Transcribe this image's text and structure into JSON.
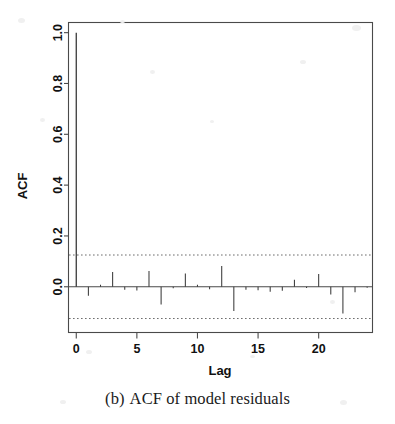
{
  "figure": {
    "caption_label": "(b)",
    "caption_text": "ACF of model residuals",
    "background_color": "#ffffff",
    "ink_color": "#3a3a3a"
  },
  "chart_data": {
    "type": "bar",
    "title": "",
    "subtitle": "",
    "xlabel": "Lag",
    "ylabel": "ACF",
    "xlim": [
      -0.6,
      24.4
    ],
    "ylim": [
      -0.18,
      1.04
    ],
    "xticks": [
      0,
      5,
      10,
      15,
      20
    ],
    "xtick_labels": [
      "0",
      "5",
      "10",
      "15",
      "20"
    ],
    "yticks": [
      0.0,
      0.2,
      0.4,
      0.6,
      0.8,
      1.0
    ],
    "ytick_labels": [
      "0.0",
      "0.2",
      "0.4",
      "0.6",
      "0.8",
      "1.0"
    ],
    "grid": false,
    "legend": null,
    "zero_line": 0.0,
    "confidence_bands": {
      "upper": 0.125,
      "lower": -0.125,
      "style": "dotted",
      "label": "95% significance bounds"
    },
    "categories": [
      0,
      1,
      2,
      3,
      4,
      5,
      6,
      7,
      8,
      9,
      10,
      11,
      12,
      13,
      14,
      15,
      16,
      17,
      18,
      19,
      20,
      21,
      22,
      23,
      24
    ],
    "x": [
      0,
      1,
      2,
      3,
      4,
      5,
      6,
      7,
      8,
      9,
      10,
      11,
      12,
      13,
      14,
      15,
      16,
      17,
      18,
      19,
      20,
      21,
      22,
      23,
      24
    ],
    "values": [
      1.0,
      -0.035,
      0.008,
      0.058,
      -0.012,
      -0.015,
      0.062,
      -0.07,
      -0.006,
      0.052,
      0.008,
      -0.01,
      0.082,
      -0.095,
      -0.012,
      -0.014,
      -0.02,
      -0.016,
      0.028,
      -0.005,
      0.05,
      -0.03,
      -0.105,
      -0.022,
      -0.004
    ],
    "series": [
      {
        "name": "ACF of model residuals",
        "values": [
          1.0,
          -0.035,
          0.008,
          0.058,
          -0.012,
          -0.015,
          0.062,
          -0.07,
          -0.006,
          0.052,
          0.008,
          -0.01,
          0.082,
          -0.095,
          -0.012,
          -0.014,
          -0.02,
          -0.016,
          0.028,
          -0.005,
          0.05,
          -0.03,
          -0.105,
          -0.022,
          -0.004
        ]
      }
    ],
    "annotations": []
  }
}
